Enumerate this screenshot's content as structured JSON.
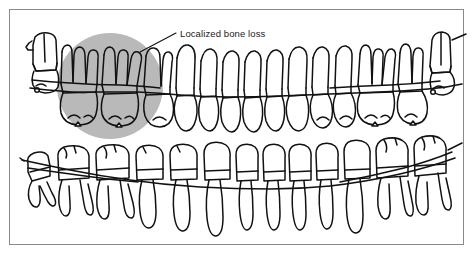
{
  "figure": {
    "background_color": "#ffffff",
    "frame": {
      "border_color": "#8a8a8a",
      "border_width_px": 1.5,
      "x": 9,
      "y": 9,
      "width": 455,
      "height": 236
    }
  },
  "annotations": [
    {
      "id": "localized-bone-loss",
      "label": "Localized bone loss",
      "text_x": 178,
      "text_y": 37,
      "leader_from_x": 176,
      "leader_from_y": 33,
      "leader_to_x": 140,
      "leader_to_y": 52,
      "text_color": "#1a1a1a",
      "font_size_px": 9.5
    }
  ],
  "highlight_region": {
    "name": "bone-loss-shading",
    "shape": "circle",
    "center_x": 110,
    "center_y": 86,
    "radius": 53,
    "fill_color": "#b9b9b9",
    "description": "Gray circular shading over the maxillary left posterior region indicating localized bone loss"
  },
  "arches": [
    {
      "name": "maxillary-arch",
      "position": "upper",
      "description": "Upper dental arch, roots pointing upward, crowns downward, with alveolar bone crest line crossing the roots",
      "stroke_color": "#111111",
      "tooth_count": 16
    },
    {
      "name": "mandibular-arch",
      "position": "lower",
      "description": "Lower dental arch, crowns on top, long roots pointing downward, with alveolar bone crest line crossing the roots",
      "stroke_color": "#111111",
      "tooth_count": 16
    }
  ],
  "bone_lines": [
    {
      "name": "maxillary-bone-crest",
      "description": "Alveolar crest line across upper arch, dipping apically within the shaded bone-loss zone"
    },
    {
      "name": "mandibular-bone-crest",
      "description": "Alveolar crest line across lower arch, curving downward toward the midline"
    }
  ],
  "colors": {
    "ink": "#111111",
    "shading": "#b9b9b9",
    "frame": "#8a8a8a",
    "paper": "#ffffff"
  }
}
